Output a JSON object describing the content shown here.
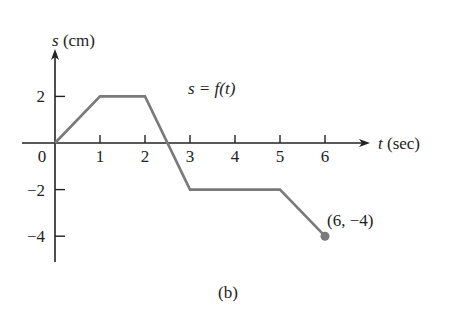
{
  "chart_data": {
    "type": "line",
    "title": "s = f(t)",
    "caption": "(b)",
    "xlabel_var": "t",
    "xlabel_unit": "(sec)",
    "ylabel_var": "s",
    "ylabel_unit": "(cm)",
    "x_ticks": [
      "1",
      "2",
      "3",
      "4",
      "5",
      "6"
    ],
    "y_ticks": [
      "2",
      "-2",
      "-4"
    ],
    "origin_label": "0",
    "xlim": [
      0,
      6.5
    ],
    "ylim": [
      -5,
      4
    ],
    "grid": false,
    "series": [
      {
        "name": "s = f(t)",
        "x": [
          0,
          1,
          2,
          3,
          5,
          6
        ],
        "y": [
          0,
          2,
          2,
          -2,
          -2,
          -4
        ]
      }
    ],
    "annotations": [
      {
        "text": "(6, −4)",
        "x": 6,
        "y": -4,
        "marker": "filled-circle"
      }
    ],
    "colors": {
      "line": "#7a7a7a",
      "axis": "#222222",
      "point": "#7a7a7a"
    }
  }
}
